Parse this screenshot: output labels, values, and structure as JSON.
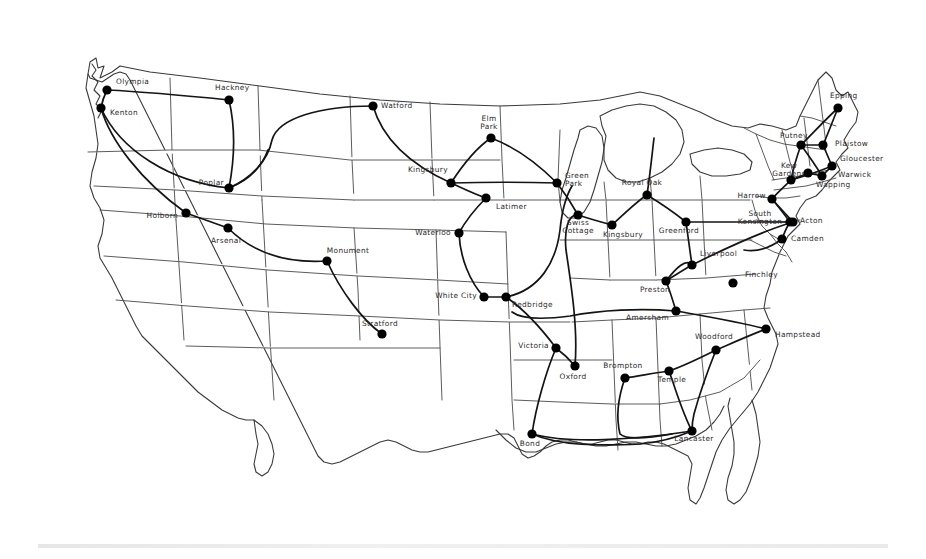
{
  "map": {
    "title": "United States Network Map",
    "region": "United States",
    "background_color": "#ffffff",
    "outline_color": "#4a4a4a",
    "route_color": "#141414",
    "node_color": "#000000",
    "label_color": "#2b2b2b",
    "node_count": 41
  },
  "chart_data": {
    "type": "scatter",
    "xlabel": "",
    "ylabel": "",
    "xlim": [
      0,
      926
    ],
    "ylim": [
      0,
      559
    ],
    "grid": false,
    "legend": "none",
    "nodes": [
      {
        "label": "Olympia",
        "x": 107,
        "y": 90,
        "lx": 116,
        "ly": 84,
        "anchor": "start"
      },
      {
        "label": "Kenton",
        "x": 101,
        "y": 108,
        "lx": 110,
        "ly": 115,
        "anchor": "start"
      },
      {
        "label": "Hackney",
        "x": 229,
        "y": 100,
        "lx": 215,
        "ly": 90,
        "anchor": "start"
      },
      {
        "label": "Poplar",
        "x": 229,
        "y": 188,
        "lx": 224,
        "ly": 185,
        "anchor": "end"
      },
      {
        "label": "Holborn",
        "x": 186,
        "y": 213,
        "lx": 178,
        "ly": 218,
        "anchor": "end"
      },
      {
        "label": "Arsenal",
        "x": 228,
        "y": 228,
        "lx": 226,
        "ly": 243,
        "anchor": "middle"
      },
      {
        "label": "Monument",
        "x": 327,
        "y": 261,
        "lx": 348,
        "ly": 253,
        "anchor": "middle"
      },
      {
        "label": "Stratford",
        "x": 382,
        "y": 334,
        "lx": 380,
        "ly": 326,
        "anchor": "middle"
      },
      {
        "label": "Watford",
        "x": 373,
        "y": 106,
        "lx": 381,
        "ly": 108,
        "anchor": "start"
      },
      {
        "label": "Kingsbury-West",
        "x": 451,
        "y": 183,
        "lx": 448,
        "ly": 172,
        "anchor": "end"
      },
      {
        "label": "Elm Park",
        "x": 491,
        "y": 138,
        "lx": 489,
        "ly": 121,
        "anchor": "middle"
      },
      {
        "label": "Green Park",
        "x": 557,
        "y": 183,
        "lx": 565,
        "ly": 178,
        "anchor": "start"
      },
      {
        "label": "Latimer",
        "x": 486,
        "y": 198,
        "lx": 496,
        "ly": 209,
        "anchor": "start"
      },
      {
        "label": "Waterloo",
        "x": 459,
        "y": 233,
        "lx": 451,
        "ly": 235,
        "anchor": "end"
      },
      {
        "label": "White City",
        "x": 484,
        "y": 297,
        "lx": 477,
        "ly": 298,
        "anchor": "end"
      },
      {
        "label": "Redbridge",
        "x": 506,
        "y": 297,
        "lx": 512,
        "ly": 307,
        "anchor": "start"
      },
      {
        "label": "Victoria",
        "x": 556,
        "y": 348,
        "lx": 549,
        "ly": 348,
        "anchor": "end"
      },
      {
        "label": "Oxford",
        "x": 575,
        "y": 366,
        "lx": 573,
        "ly": 379,
        "anchor": "middle"
      },
      {
        "label": "Bond",
        "x": 532,
        "y": 434,
        "lx": 530,
        "ly": 446,
        "anchor": "middle"
      },
      {
        "label": "Swiss Cottage",
        "x": 578,
        "y": 215,
        "lx": 578,
        "ly": 225,
        "anchor": "middle"
      },
      {
        "label": "Kingsbury",
        "x": 612,
        "y": 225,
        "lx": 623,
        "ly": 237,
        "anchor": "middle"
      },
      {
        "label": "Royal Oak",
        "x": 647,
        "y": 195,
        "lx": 642,
        "ly": 185,
        "anchor": "middle"
      },
      {
        "label": "Greenford",
        "x": 686,
        "y": 222,
        "lx": 679,
        "ly": 233,
        "anchor": "middle"
      },
      {
        "label": "Liverpool",
        "x": 692,
        "y": 265,
        "lx": 700,
        "ly": 256,
        "anchor": "start"
      },
      {
        "label": "Preston",
        "x": 666,
        "y": 281,
        "lx": 655,
        "ly": 292,
        "anchor": "middle"
      },
      {
        "label": "Amersham",
        "x": 676,
        "y": 311,
        "lx": 669,
        "ly": 320,
        "anchor": "end"
      },
      {
        "label": "Finchley",
        "x": 733,
        "y": 283,
        "lx": 745,
        "ly": 277,
        "anchor": "start"
      },
      {
        "label": "Hampstead",
        "x": 766,
        "y": 329,
        "lx": 775,
        "ly": 337,
        "anchor": "start"
      },
      {
        "label": "Woodford",
        "x": 716,
        "y": 350,
        "lx": 714,
        "ly": 339,
        "anchor": "middle"
      },
      {
        "label": "Temple",
        "x": 669,
        "y": 371,
        "lx": 672,
        "ly": 382,
        "anchor": "middle"
      },
      {
        "label": "Brompton",
        "x": 625,
        "y": 378,
        "lx": 623,
        "ly": 368,
        "anchor": "middle"
      },
      {
        "label": "Lancaster",
        "x": 692,
        "y": 431,
        "lx": 694,
        "ly": 441,
        "anchor": "middle"
      },
      {
        "label": "Epping",
        "x": 838,
        "y": 108,
        "lx": 830,
        "ly": 98,
        "anchor": "start"
      },
      {
        "label": "Putney",
        "x": 801,
        "y": 145,
        "lx": 780,
        "ly": 138,
        "anchor": "start"
      },
      {
        "label": "Plaistow",
        "x": 823,
        "y": 145,
        "lx": 835,
        "ly": 146,
        "anchor": "start"
      },
      {
        "label": "Gloucester",
        "x": 832,
        "y": 166,
        "lx": 840,
        "ly": 161,
        "anchor": "start"
      },
      {
        "label": "Kew Gardens",
        "x": 791,
        "y": 180,
        "lx": 789,
        "ly": 168,
        "anchor": "middle"
      },
      {
        "label": "Warwick",
        "x": 822,
        "y": 176,
        "lx": 838,
        "ly": 177,
        "anchor": "start"
      },
      {
        "label": "Wapping",
        "x": 808,
        "y": 173,
        "lx": 816,
        "ly": 187,
        "anchor": "start"
      },
      {
        "label": "Harrow",
        "x": 772,
        "y": 199,
        "lx": 766,
        "ly": 198,
        "anchor": "end"
      },
      {
        "label": "South Kensington",
        "x": 793,
        "y": 222,
        "lx": 760,
        "ly": 216,
        "anchor": "middle"
      },
      {
        "label": "Acton",
        "x": 790,
        "y": 222,
        "lx": 800,
        "ly": 223,
        "anchor": "start"
      },
      {
        "label": "Camden",
        "x": 782,
        "y": 239,
        "lx": 791,
        "ly": 241,
        "anchor": "start"
      }
    ]
  }
}
